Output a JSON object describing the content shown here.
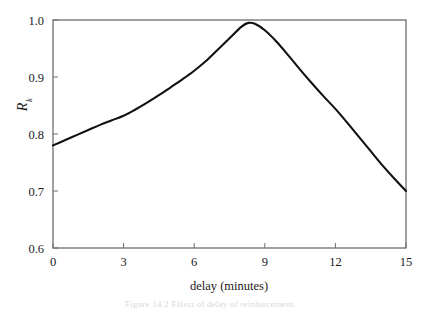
{
  "figure": {
    "caption": "Figure 14.2  Effect of delay of reinforcement.",
    "frame_color": "#6e6e72",
    "curve_color": "#111111",
    "background": "#ffffff"
  },
  "chart_data": {
    "type": "line",
    "title": "",
    "xlabel": "delay (minutes)",
    "ylabel": "R",
    "ylabel_subscript": "k",
    "xlim": [
      0,
      15
    ],
    "ylim": [
      0.6,
      1.0
    ],
    "xticks": [
      0,
      3,
      6,
      9,
      12,
      15
    ],
    "xtick_labels": [
      "0",
      "3",
      "6",
      "9",
      "12",
      "15"
    ],
    "yticks": [
      0.6,
      0.7,
      0.8,
      0.9,
      1.0
    ],
    "ytick_labels": [
      "0.6",
      "0.7",
      "0.8",
      "0.9",
      "1.0"
    ],
    "grid": false,
    "legend": null,
    "series": [
      {
        "name": "response strength",
        "x": [
          0,
          0.5,
          1,
          1.5,
          2,
          2.5,
          3,
          3.5,
          4,
          4.5,
          5,
          5.5,
          6,
          6.5,
          7,
          7.5,
          8,
          8.3,
          8.6,
          9,
          9.5,
          10,
          10.5,
          11,
          11.5,
          12,
          12.5,
          13,
          13.5,
          14,
          14.5,
          15
        ],
        "y": [
          0.78,
          0.789,
          0.798,
          0.807,
          0.816,
          0.824,
          0.832,
          0.843,
          0.855,
          0.868,
          0.882,
          0.896,
          0.911,
          0.928,
          0.948,
          0.968,
          0.988,
          0.995,
          0.993,
          0.982,
          0.962,
          0.938,
          0.913,
          0.889,
          0.866,
          0.844,
          0.82,
          0.795,
          0.77,
          0.745,
          0.722,
          0.7
        ]
      }
    ],
    "peak": {
      "x": 8.3,
      "y": 0.995
    },
    "start": {
      "x": 0,
      "y": 0.78
    },
    "end": {
      "x": 15,
      "y": 0.7
    }
  }
}
